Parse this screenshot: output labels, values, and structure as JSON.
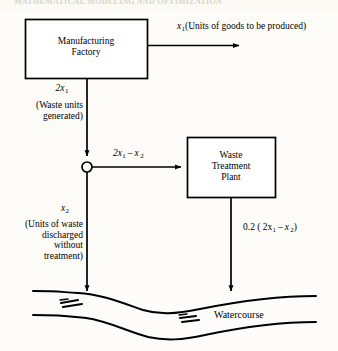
{
  "page": {
    "header_text": "MATHEMATICAL MODELING AND OPTIMIZATION",
    "width": 338,
    "height": 351,
    "background": "#fdfcf8",
    "ink": "#000000"
  },
  "diagram": {
    "type": "flow-diagram",
    "nodes": [
      {
        "id": "manufacturing-factory",
        "label_line1": "Manufacturing",
        "label_line2": "Factory",
        "shape": "rectangle",
        "x": 25,
        "y": 19,
        "w": 122,
        "h": 59
      },
      {
        "id": "waste-treatment-plant",
        "label_line1": "Waste",
        "label_line2": "Treatment",
        "label_line3": "Plant",
        "shape": "rectangle",
        "x": 187,
        "y": 137,
        "w": 88,
        "h": 60
      },
      {
        "id": "split-junction",
        "label": "",
        "shape": "circle",
        "cx": 87,
        "cy": 167,
        "r": 5
      },
      {
        "id": "watercourse",
        "label": "Watercourse",
        "shape": "river"
      }
    ],
    "edges": [
      {
        "id": "goods-output",
        "from": "manufacturing-factory",
        "to": "",
        "label_main": "x",
        "label_sub": "1",
        "label_rest": "(Units of goods to be produced)",
        "direction": "right"
      },
      {
        "id": "waste-generated",
        "from": "manufacturing-factory",
        "to": "split-junction",
        "label_main": "2x",
        "label_sub": "1",
        "label_note_line1": "(Waste units",
        "label_note_line2": "generated)",
        "direction": "down"
      },
      {
        "id": "to-treatment",
        "from": "split-junction",
        "to": "waste-treatment-plant",
        "label_a": "2x",
        "label_a_sub": "1",
        "label_minus": "–",
        "label_b": "x",
        "label_b_sub": "2",
        "direction": "right"
      },
      {
        "id": "untreated-discharge",
        "from": "split-junction",
        "to": "watercourse",
        "label_main": "x",
        "label_sub": "2",
        "note_line1": "(Units of waste",
        "note_line2": "discharged",
        "note_line3": "without",
        "note_line4": "treatment)",
        "direction": "down"
      },
      {
        "id": "treated-discharge",
        "from": "waste-treatment-plant",
        "to": "watercourse",
        "label_prefix": "0.2 ( 2x",
        "label_sub1": "1",
        "label_minus": "–",
        "label_mid": "x",
        "label_sub2": "2",
        "label_suffix": ")",
        "direction": "down"
      }
    ]
  },
  "labels": {
    "factory_line1": "Manufacturing",
    "factory_line2": "Factory",
    "plant_line1": "Waste",
    "plant_line2": "Treatment",
    "plant_line3": "Plant",
    "watercourse": "Watercourse",
    "goods_rest": "(Units of goods to be produced)",
    "waste_note_1": "(Waste units",
    "waste_note_2": "generated)",
    "untreated_note_1": "(Units of waste",
    "untreated_note_2": "discharged",
    "untreated_note_3": "without",
    "untreated_note_4": "treatment)",
    "x": "x",
    "two_x": "2x",
    "one": "1",
    "two": "2",
    "minus": "–",
    "treated_prefix": "0.2 ( 2x",
    "treated_mid": "x",
    "treated_suffix": ")"
  }
}
